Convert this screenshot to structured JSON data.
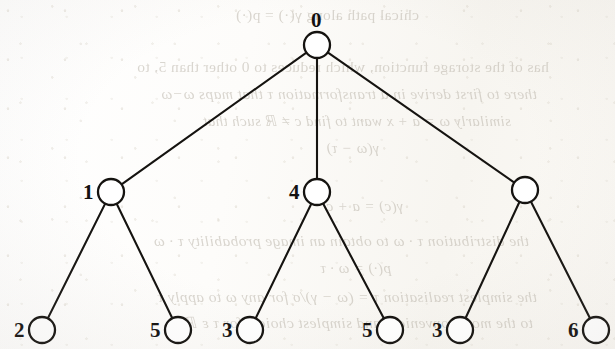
{
  "document": {
    "type": "scanned-book-page",
    "figure_kind": "tree-diagram"
  },
  "tree": {
    "root": {
      "id": "root",
      "label": "0",
      "cx": 317,
      "cy": 45,
      "r": 13
    },
    "internal_nodes": [
      {
        "id": "n1",
        "label": "1",
        "cx": 111,
        "cy": 192,
        "r": 13,
        "label_side": "left"
      },
      {
        "id": "n2",
        "label": "4",
        "cx": 317,
        "cy": 192,
        "r": 13,
        "label_side": "left"
      },
      {
        "id": "n3",
        "label": "",
        "cx": 525,
        "cy": 190,
        "r": 13,
        "label_side": "left"
      }
    ],
    "leaf_nodes": [
      {
        "id": "l1",
        "label": "2",
        "cx": 42,
        "cy": 330,
        "r": 13,
        "parent": "n1"
      },
      {
        "id": "l2",
        "label": "5",
        "cx": 178,
        "cy": 330,
        "r": 13,
        "parent": "n1"
      },
      {
        "id": "l3",
        "label": "3",
        "cx": 250,
        "cy": 330,
        "r": 13,
        "parent": "n2"
      },
      {
        "id": "l4",
        "label": "5",
        "cx": 390,
        "cy": 330,
        "r": 13,
        "parent": "n2"
      },
      {
        "id": "l5",
        "label": "3",
        "cx": 460,
        "cy": 330,
        "r": 13,
        "parent": "n3"
      },
      {
        "id": "l6",
        "label": "6",
        "cx": 596,
        "cy": 330,
        "r": 13,
        "parent": "n3"
      }
    ],
    "edges": [
      {
        "from": "root",
        "to": "n1"
      },
      {
        "from": "root",
        "to": "n2"
      },
      {
        "from": "root",
        "to": "n3"
      },
      {
        "from": "n1",
        "to": "l1"
      },
      {
        "from": "n1",
        "to": "l2"
      },
      {
        "from": "n2",
        "to": "l3"
      },
      {
        "from": "n2",
        "to": "l4"
      },
      {
        "from": "n3",
        "to": "l5"
      },
      {
        "from": "n3",
        "to": "l6"
      }
    ],
    "ink_color": "#151310",
    "node_fill": "#ffffff"
  },
  "bleed_text": {
    "note": "faint mirrored show-through text from the reverse side of the page",
    "color": "#b9b3a8",
    "lines": [
      {
        "text": "chical path along",
        "math": "γ(·) = p(·)",
        "x": 196,
        "y": 6,
        "size": 15.5
      },
      {
        "text": "has of the storage function, which reduces to 0 other than 5, to",
        "x": 66,
        "y": 58,
        "size": 15.5
      },
      {
        "text": "there to first derive in a transformation  τ  that maps ω−ω",
        "x": 78,
        "y": 85,
        "size": 15.5
      },
      {
        "text": "similarly ω = a + x  want to find  c ≠  ℝ  such that",
        "x": 104,
        "y": 112,
        "size": 15
      },
      {
        "text": "γ(ω − τ)",
        "x": 236,
        "y": 140,
        "size": 15
      },
      {
        "text": "γ(c) = a + c",
        "x": 212,
        "y": 198,
        "size": 15
      },
      {
        "text": "the distribution  τ · ω  to obtain an image probability  τ · ω",
        "x": 86,
        "y": 232,
        "size": 15.5
      },
      {
        "text": "p(·) = ω · τ",
        "x": 224,
        "y": 260,
        "size": 15
      },
      {
        "text": "the simplest realisation  τ = (ω − γ)/σ  for any  ω  to apply  τ",
        "x": 78,
        "y": 288,
        "size": 15.5
      },
      {
        "text": "to the most convenient and simplest choice, for  τ ε ℝ",
        "x": 82,
        "y": 314,
        "size": 15.5
      }
    ]
  }
}
